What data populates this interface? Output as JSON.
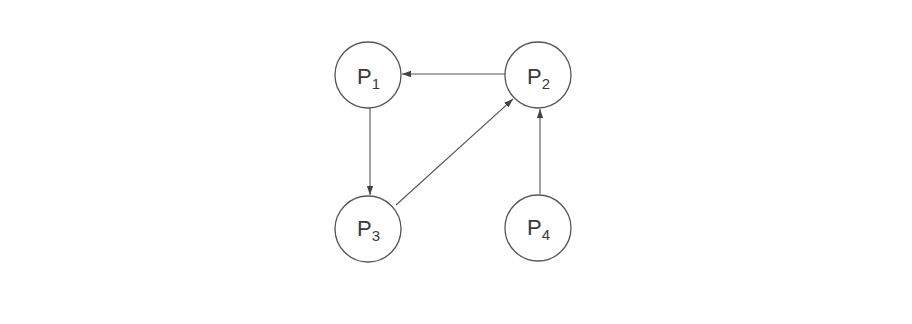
{
  "diagram": {
    "type": "directed-graph",
    "style": {
      "stroke": "#555555",
      "background": "#ffffff",
      "text": "#3a3a3a"
    },
    "nodes": [
      {
        "id": "P1",
        "base": "P",
        "sub": "1",
        "cx": 368,
        "cy": 75,
        "r": 33
      },
      {
        "id": "P2",
        "base": "P",
        "sub": "2",
        "cx": 538,
        "cy": 75,
        "r": 33
      },
      {
        "id": "P3",
        "base": "P",
        "sub": "3",
        "cx": 368,
        "cy": 229,
        "r": 33
      },
      {
        "id": "P4",
        "base": "P",
        "sub": "4",
        "cx": 538,
        "cy": 228,
        "r": 33
      }
    ],
    "edges": [
      {
        "from": "P2",
        "to": "P1"
      },
      {
        "from": "P1",
        "to": "P3"
      },
      {
        "from": "P3",
        "to": "P2"
      },
      {
        "from": "P4",
        "to": "P2"
      }
    ]
  }
}
